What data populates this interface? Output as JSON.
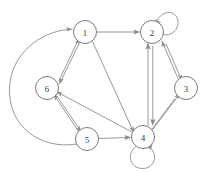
{
  "diagram": {
    "type": "directed-graph",
    "title": "",
    "node_radius": 11.5,
    "colors": {
      "node_fill": "#ffffff",
      "node_stroke": "#7a7a7a",
      "edge_stroke": "#8d8d8d",
      "label_color": "#3a3a3a",
      "background": "#ffffff"
    },
    "nodes": [
      {
        "id": "1",
        "label": "1",
        "x": 85,
        "y": 32
      },
      {
        "id": "2",
        "label": "2",
        "x": 152,
        "y": 32
      },
      {
        "id": "3",
        "label": "3",
        "x": 186,
        "y": 88
      },
      {
        "id": "4",
        "label": "4",
        "x": 143,
        "y": 137
      },
      {
        "id": "5",
        "label": "5",
        "x": 87,
        "y": 139
      },
      {
        "id": "6",
        "label": "6",
        "x": 47,
        "y": 88
      }
    ],
    "edges": [
      {
        "from": "1",
        "to": "2",
        "style": "straight",
        "arrow": "to"
      },
      {
        "from": "1",
        "to": "4",
        "style": "straight",
        "arrow": "to"
      },
      {
        "from": "1",
        "to": "6",
        "style": "parallel-pair",
        "arrow": "both"
      },
      {
        "from": "6",
        "to": "5",
        "style": "parallel-pair",
        "arrow": "both"
      },
      {
        "from": "5",
        "to": "4",
        "style": "straight",
        "arrow": "to"
      },
      {
        "from": "4",
        "to": "6",
        "style": "straight",
        "arrow": "to"
      },
      {
        "from": "2",
        "to": "4",
        "style": "parallel-pair",
        "arrow": "both"
      },
      {
        "from": "2",
        "to": "3",
        "style": "parallel-pair",
        "arrow": "both"
      },
      {
        "from": "3",
        "to": "4",
        "style": "parallel-pair",
        "arrow": "both"
      },
      {
        "from": "5",
        "to": "1",
        "style": "curved-arc-left",
        "arrow": "to"
      },
      {
        "from": "2",
        "to": "2",
        "style": "self-loop",
        "arrow": "to",
        "loop_side": "upper-right"
      },
      {
        "from": "4",
        "to": "4",
        "style": "self-loop",
        "arrow": "to",
        "loop_side": "below"
      }
    ]
  }
}
